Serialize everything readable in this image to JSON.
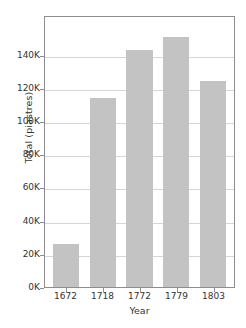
{
  "chart_data": {
    "type": "bar",
    "title": "",
    "xlabel": "Year",
    "ylabel": "Total (piastres)",
    "categories": [
      "1672",
      "1718",
      "1772",
      "1779",
      "1803"
    ],
    "values": [
      26000,
      114000,
      143000,
      151000,
      124000
    ],
    "ylim": [
      0,
      164000
    ],
    "yticks": [
      0,
      20000,
      40000,
      60000,
      80000,
      100000,
      120000,
      140000
    ],
    "ytick_labels": [
      "0K",
      "20K",
      "40K",
      "60K",
      "80K",
      "100K",
      "120K",
      "140K"
    ],
    "grid": true,
    "legend": false,
    "bar_color": "#c3c3c3",
    "grid_color": "#d6d6d6",
    "axis_color": "#8d8d8d",
    "text_color": "#333333"
  }
}
